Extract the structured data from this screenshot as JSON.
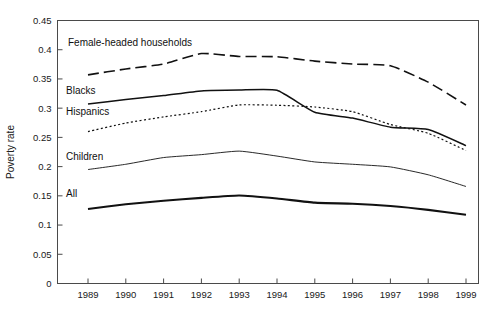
{
  "figure": {
    "background": "#ffffff",
    "line_color": "#111111",
    "axis_color": "#4a4a4a"
  },
  "chart_data": {
    "type": "line",
    "title": "",
    "xlabel": "",
    "ylabel": "Poverty rate",
    "xlim": [
      1989,
      1999
    ],
    "ylim": [
      0,
      0.45
    ],
    "grid": false,
    "legend_position": "inline-annotations",
    "x": [
      1989,
      1990,
      1991,
      1992,
      1993,
      1994,
      1995,
      1996,
      1997,
      1998,
      1999
    ],
    "xtick_labels": [
      "1989",
      "1990",
      "1991",
      "1992",
      "1993",
      "1994",
      "1995",
      "1996",
      "1997",
      "1998",
      "1999"
    ],
    "ytick_labels": [
      "0",
      "0.05",
      "0.1",
      "0.15",
      "0.2",
      "0.25",
      "0.3",
      "0.35",
      "0.4",
      "0.45"
    ],
    "ytick_values": [
      0,
      0.05,
      0.1,
      0.15,
      0.2,
      0.25,
      0.3,
      0.35,
      0.4,
      0.45
    ],
    "series": [
      {
        "name": "Female-headed households",
        "label": "Female-headed households",
        "style": "long-dash",
        "width": 1.6,
        "values": [
          0.357,
          0.367,
          0.3755,
          0.3935,
          0.3885,
          0.388,
          0.3805,
          0.3755,
          0.3725,
          0.3445,
          0.3055
        ]
      },
      {
        "name": "Blacks",
        "label": "Blacks",
        "style": "solid",
        "width": 1.5,
        "values": [
          0.307,
          0.315,
          0.3215,
          0.3295,
          0.331,
          0.3305,
          0.293,
          0.283,
          0.2675,
          0.2635,
          0.236
        ]
      },
      {
        "name": "Hispanics",
        "label": "Hispanics",
        "style": "dotted",
        "width": 1.2,
        "values": [
          0.26,
          0.2745,
          0.285,
          0.294,
          0.3055,
          0.305,
          0.302,
          0.294,
          0.272,
          0.257,
          0.2275
        ]
      },
      {
        "name": "Children",
        "label": "Children",
        "style": "solid",
        "width": 0.9,
        "values": [
          0.195,
          0.204,
          0.2155,
          0.2205,
          0.2265,
          0.218,
          0.208,
          0.204,
          0.1995,
          0.186,
          0.166
        ]
      },
      {
        "name": "All",
        "label": "All",
        "style": "solid",
        "width": 2.1,
        "values": [
          0.1275,
          0.1355,
          0.1415,
          0.1465,
          0.1505,
          0.1455,
          0.1383,
          0.1365,
          0.1325,
          0.126,
          0.1175
        ]
      }
    ],
    "annotations": [
      {
        "text": "Female-headed households",
        "x_px": 68,
        "y_px": 46
      },
      {
        "text": "Blacks",
        "x_px": 66,
        "y_px": 94
      },
      {
        "text": "Hispanics",
        "x_px": 66,
        "y_px": 115
      },
      {
        "text": "Children",
        "x_px": 66,
        "y_px": 160
      },
      {
        "text": "All",
        "x_px": 66,
        "y_px": 197
      }
    ]
  }
}
